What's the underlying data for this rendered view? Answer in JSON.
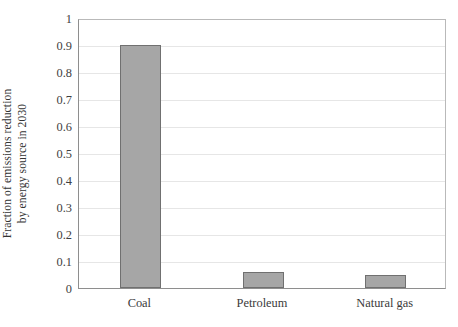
{
  "chart_data": {
    "type": "bar",
    "title": "",
    "subtitle": "",
    "xlabel": "",
    "ylabel": "Fraction of emissions reduction by energy source in 2030",
    "ylabel_lines": [
      "Fraction of emissions reduction",
      "by energy source in 2030"
    ],
    "categories": [
      "Coal",
      "Petroleum",
      "Natural gas"
    ],
    "values": [
      0.9,
      0.06,
      0.05
    ],
    "ylim": [
      0,
      1
    ],
    "ytick_values": [
      0,
      0.1,
      0.2,
      0.3,
      0.4,
      0.5,
      0.6,
      0.7,
      0.8,
      0.9,
      1
    ],
    "ytick_labels": [
      "0",
      "0.1",
      "0.2",
      "0.3",
      "0.4",
      "0.5",
      "0.6",
      "0.7",
      "0.8",
      "0.9",
      "1"
    ],
    "grid": true,
    "grid_axis": "y",
    "legend": false,
    "legend_position": "none",
    "annotations": [],
    "colors": {
      "bar_fill": "#a6a6a6",
      "bar_border": "#707070",
      "gridline": "#e6e6e6",
      "axis_line": "#8e8e8e",
      "plot_border": "#b9b9b9",
      "text": "#3a3a3a",
      "background": "#ffffff"
    }
  }
}
